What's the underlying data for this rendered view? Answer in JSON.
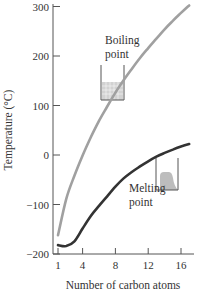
{
  "chart_data": {
    "type": "line",
    "title": "",
    "xlabel": "Number of carbon atoms",
    "ylabel": "Temperature (°C)",
    "xlim": [
      1,
      17
    ],
    "ylim": [
      -200,
      300
    ],
    "x_ticks": [
      "1",
      "4",
      "8",
      "12",
      "16"
    ],
    "y_ticks": [
      "300",
      "200",
      "100",
      "0",
      "−100",
      "−200"
    ],
    "grid": false,
    "legend": "none (inline annotations)",
    "series": [
      {
        "name": "Boiling point",
        "color": "#a0a0a0",
        "x": [
          1,
          2,
          3,
          4,
          5,
          6,
          7,
          8,
          9,
          10,
          11,
          12,
          13,
          14,
          15,
          16,
          17
        ],
        "values": [
          -162,
          -89,
          -42,
          -1,
          36,
          69,
          98,
          126,
          151,
          174,
          196,
          216,
          235,
          254,
          271,
          287,
          302
        ]
      },
      {
        "name": "Melting point",
        "color": "#333333",
        "x": [
          1,
          2,
          3,
          4,
          5,
          6,
          7,
          8,
          9,
          10,
          11,
          12,
          13,
          14,
          15,
          16,
          17
        ],
        "values": [
          -182,
          -183,
          -188,
          -138,
          -130,
          -95,
          -91,
          -57,
          -51,
          -30,
          -26,
          -10,
          -5,
          6,
          10,
          18,
          22
        ]
      }
    ],
    "annotations": [
      {
        "text_lines": [
          "Boiling",
          "point"
        ],
        "icon": "beaker-with-liquid-icon"
      },
      {
        "text_lines": [
          "Melting",
          "point"
        ],
        "icon": "beaker-with-melting-solid-icon"
      }
    ]
  },
  "labels": {
    "y_axis_title": "Temperature (°C)",
    "x_axis_title": "Number of carbon atoms",
    "boiling_line1": "Boiling",
    "boiling_line2": "point",
    "melting_line1": "Melting",
    "melting_line2": "point"
  }
}
